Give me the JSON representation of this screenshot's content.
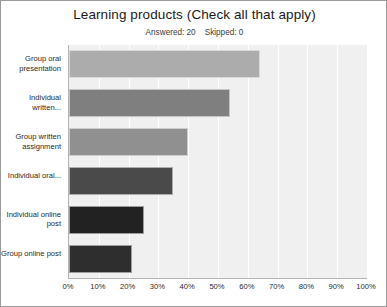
{
  "chart_data": {
    "type": "bar",
    "orientation": "horizontal",
    "title": "Learning products (Check all that apply)",
    "answered_label": "Answered: 20",
    "skipped_label": "Skipped: 0",
    "categories": [
      "Group oral presentation",
      "Individual written...",
      "Group written assignment",
      "Individual oral...",
      "Individual online post",
      "Group online post"
    ],
    "values": [
      64,
      54,
      40,
      35,
      25,
      21
    ],
    "bar_colors": [
      "#acacac",
      "#7f7f7f",
      "#909090",
      "#4a4a4a",
      "#222222",
      "#2e2e2e"
    ],
    "xlabel": "",
    "ylabel": "",
    "xlim": [
      0,
      100
    ],
    "x_ticks": [
      0,
      10,
      20,
      30,
      40,
      50,
      60,
      70,
      80,
      90,
      100
    ],
    "x_tick_labels": [
      "0%",
      "10%",
      "20%",
      "30%",
      "40%",
      "50%",
      "60%",
      "70%",
      "80%",
      "90%",
      "100%"
    ],
    "grid": true,
    "grid_color": "#ffffff",
    "plot_background": "#f0f0f0",
    "legend": null
  }
}
